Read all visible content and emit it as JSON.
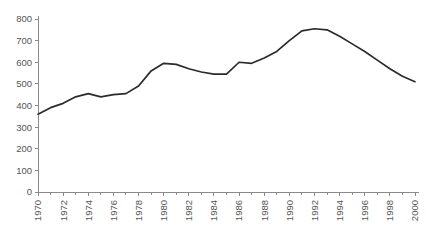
{
  "chart_data": {
    "type": "line",
    "title": "",
    "subtitle": "",
    "xlabel": "",
    "ylabel": "",
    "grid": false,
    "legend": false,
    "legend_position": "none",
    "line_color": "#2b2b2b",
    "axis_color": "#8a8a8a",
    "tick_label_color": "#555555",
    "background_color": "#ffffff",
    "xlim": [
      1970,
      2000
    ],
    "ylim": [
      0,
      800
    ],
    "y_ticks": [
      0,
      100,
      200,
      300,
      400,
      500,
      600,
      700,
      800
    ],
    "y_tick_labels": [
      "0",
      "100",
      "200",
      "300",
      "400",
      "500",
      "600",
      "700",
      "800"
    ],
    "x_ticks": [
      1970,
      1972,
      1974,
      1976,
      1978,
      1980,
      1982,
      1984,
      1986,
      1988,
      1990,
      1992,
      1994,
      1996,
      1998,
      2000
    ],
    "x_tick_labels": [
      "1970",
      "1972",
      "1974",
      "1976",
      "1978",
      "1980",
      "1982",
      "1984",
      "1986",
      "1988",
      "1990",
      "1992",
      "1994",
      "1996",
      "1998",
      "2000"
    ],
    "x_tick_rotation": 90,
    "x_minor_ticks": [
      1971,
      1973,
      1975,
      1977,
      1979,
      1981,
      1983,
      1985,
      1987,
      1989,
      1991,
      1993,
      1995,
      1997,
      1999
    ],
    "x": [
      1970,
      1971,
      1972,
      1973,
      1974,
      1975,
      1976,
      1977,
      1978,
      1979,
      1980,
      1981,
      1982,
      1983,
      1984,
      1985,
      1986,
      1987,
      1988,
      1989,
      1990,
      1991,
      1992,
      1993,
      1994,
      1995,
      1996,
      1997,
      1998,
      1999,
      2000
    ],
    "values": [
      360,
      390,
      410,
      440,
      455,
      440,
      450,
      455,
      490,
      560,
      595,
      590,
      570,
      555,
      545,
      545,
      600,
      595,
      620,
      650,
      700,
      745,
      755,
      750,
      720,
      685,
      650,
      610,
      570,
      535,
      510
    ],
    "series": [
      {
        "name": "series-1",
        "values": [
          360,
          390,
          410,
          440,
          455,
          440,
          450,
          455,
          490,
          560,
          595,
          590,
          570,
          555,
          545,
          545,
          600,
          595,
          620,
          650,
          700,
          745,
          755,
          750,
          720,
          685,
          650,
          610,
          570,
          535,
          510
        ]
      }
    ]
  }
}
